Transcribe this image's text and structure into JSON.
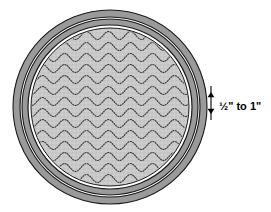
{
  "diagram": {
    "type": "technical-illustration",
    "canvas": {
      "width": 271,
      "height": 212,
      "background": "#ffffff"
    },
    "shape": {
      "name": "circle",
      "center_x": 110,
      "center_y": 107,
      "rings": [
        {
          "name": "outer-wall",
          "radius": 97,
          "fill": "#9a9a9a",
          "stroke": "#1a1a1a",
          "stroke_width": 1.1
        },
        {
          "name": "outer-gap",
          "radius": 90,
          "fill": "#fdfdfd",
          "stroke": "#1a1a1a",
          "stroke_width": 1.1
        },
        {
          "name": "inner-wall",
          "radius": 88,
          "fill": "#9a9a9a",
          "stroke": "#1a1a1a",
          "stroke_width": 1.1
        },
        {
          "name": "inner-gap",
          "radius": 82,
          "fill": "#ffffff",
          "stroke": "#1a1a1a",
          "stroke_width": 1.2
        },
        {
          "name": "interior-fill",
          "radius": 79,
          "fill": "#c9c9c9",
          "stroke": "#1a1a1a",
          "stroke_width": 1.0
        }
      ]
    },
    "interior_pattern": {
      "name": "dotted-wavy-lines",
      "row_count": 14,
      "row_spacing": 11,
      "wave_amplitude": 4,
      "wave_period": 22,
      "dot_color": "#3a3a3a",
      "fill_texture": "stipple"
    },
    "dimension": {
      "name": "edge-thickness-callout",
      "label": "½\" to 1\"",
      "min_value": "½\"",
      "max_value": "1\"",
      "unit": "inch",
      "line_x": 211,
      "top_y": 92,
      "bottom_y": 114,
      "arrow_direction": "outward-both",
      "text_x": 219,
      "text_y": 107,
      "color": "#000000"
    }
  }
}
